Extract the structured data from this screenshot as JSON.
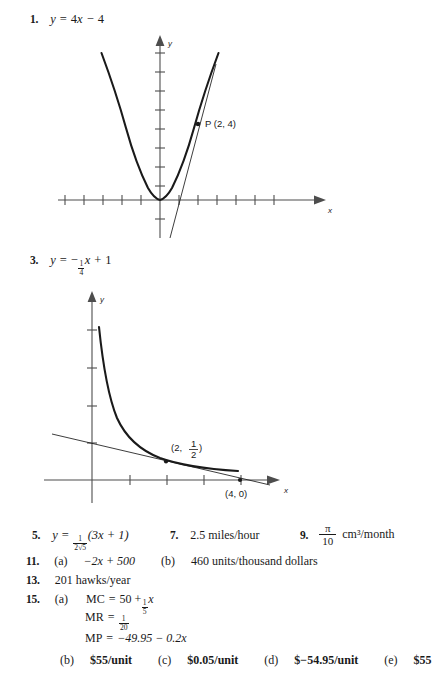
{
  "page": {
    "kind": "textbook-answer-key",
    "background": "#ffffff",
    "ink": "#1a1a1a"
  },
  "items": [
    {
      "number": "1.",
      "answer_plain": "y = 4x - 4",
      "answer_parts": {
        "lhs": "y",
        "eq": "=",
        "rhs_a": "4",
        "rhs_var": "x",
        "minus": "−",
        "rhs_b": "4"
      }
    },
    {
      "number": "3.",
      "answer_plain": "y = -(1/4)x + 1",
      "answer_parts": {
        "lhs": "y",
        "eq": "=",
        "sign": "−",
        "frac_n": "1",
        "frac_d": "4",
        "var": "x",
        "plus": "+",
        "const": "1"
      }
    },
    {
      "number": "5.",
      "answer_plain": "y = (1/(2√5))(3x + 1)",
      "answer_parts": {
        "lhs": "y",
        "eq": "=",
        "frac_n": "1",
        "frac_d": "2√5",
        "group": "(3x + 1)"
      }
    },
    {
      "number": "7.",
      "answer_plain": "2.5 miles/hour",
      "value": "2.5",
      "unit": "miles/hour"
    },
    {
      "number": "9.",
      "answer_plain": "π/10 cm³/month",
      "frac_n": "π",
      "frac_d": "10",
      "unit": "cm³/month"
    },
    {
      "number": "11.",
      "parts": [
        {
          "tag": "(a)",
          "text": "−2x + 500"
        },
        {
          "tag": "(b)",
          "text": "460 units/thousand dollars"
        }
      ]
    },
    {
      "number": "13.",
      "answer_plain": "201 hawks/year"
    },
    {
      "number": "15.",
      "parts": [
        {
          "tag": "(a)",
          "lines": [
            {
              "label": "MC",
              "eq": "=",
              "text": "50 +",
              "frac_n": "1",
              "frac_d": "5",
              "var": "x"
            },
            {
              "label": "MR",
              "eq": "=",
              "frac_n": "1",
              "frac_d": "20"
            },
            {
              "label": "MP",
              "eq": "=",
              "text": "−49.95 − 0.2x"
            }
          ]
        },
        {
          "tag": "(b)",
          "text": "$55/unit"
        },
        {
          "tag": "(c)",
          "text": "$0.05/unit"
        },
        {
          "tag": "(d)",
          "text": "$−54.95/unit"
        },
        {
          "tag": "(e)",
          "text": "$55"
        }
      ]
    }
  ],
  "figures": [
    {
      "id": "figure-1",
      "for_item": "1.",
      "description": "Parabola y = x^2 with tangent line at P(2,4)",
      "axis_labels": {
        "x": "x",
        "y": "y"
      },
      "point_labels": [
        {
          "text": "P (2, 4)",
          "x_data": 2,
          "y_data": 4
        }
      ],
      "x_ticks": [
        -5,
        -4,
        -3,
        -2,
        -1,
        1,
        2,
        3,
        4,
        5
      ],
      "y_ticks": [
        -1,
        1,
        2,
        3,
        4,
        5,
        6,
        7,
        8
      ],
      "curve": {
        "type": "parabola",
        "equation": "y = x^2"
      },
      "tangent": {
        "equation": "y = 4x - 4",
        "touches_at": [
          2,
          4
        ]
      }
    },
    {
      "id": "figure-2",
      "for_item": "3.",
      "description": "Hyperbola y = 1/x with tangent line at (2, 1/2) crossing x-axis at (4, 0)",
      "axis_labels": {
        "x": "x",
        "y": "y"
      },
      "point_labels": [
        {
          "text": "(2, 1/2)",
          "x_data": 2,
          "y_data": 0.5
        },
        {
          "text": "(4, 0)",
          "x_data": 4,
          "y_data": 0
        }
      ],
      "x_ticks": [
        1,
        2,
        3,
        4,
        5
      ],
      "y_ticks": [
        1,
        2,
        3,
        4
      ],
      "curve": {
        "type": "hyperbola",
        "equation": "y = 1/x"
      },
      "tangent": {
        "equation": "y = -(1/4)x + 1",
        "touches_at": [
          2,
          0.5
        ],
        "x_intercept": [
          4,
          0
        ]
      }
    }
  ]
}
